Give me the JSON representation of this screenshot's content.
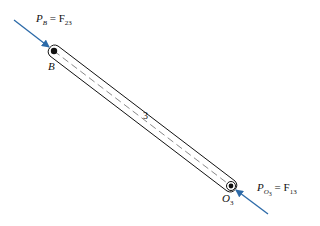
{
  "diagram": {
    "type": "free-body diagram",
    "link": {
      "label": "3",
      "end_a": {
        "label": "B",
        "x": 54,
        "y": 51
      },
      "end_b": {
        "label": "O",
        "sub": "3",
        "x": 231,
        "y": 186
      }
    },
    "forces": [
      {
        "name": "force-at-B",
        "label_main": "P",
        "label_sub": "B",
        "eq": " = F",
        "eq_sub": "23"
      },
      {
        "name": "force-at-O3",
        "label_main": "P",
        "label_sub": "O",
        "label_subsub": "3",
        "eq": " = F",
        "eq_sub": "13"
      }
    ],
    "colors": {
      "force_arrow": "#2c6aa8",
      "link": "#111111",
      "centerline": "#555555"
    }
  }
}
